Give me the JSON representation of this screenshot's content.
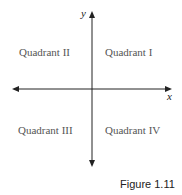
{
  "diagram": {
    "type": "coordinate-plane-quadrants",
    "axes": {
      "x_label": "x",
      "y_label": "y"
    },
    "quadrants": [
      {
        "id": "q1",
        "label": "Quadrant I"
      },
      {
        "id": "q2",
        "label": "Quadrant II"
      },
      {
        "id": "q3",
        "label": "Quadrant III"
      },
      {
        "id": "q4",
        "label": "Quadrant IV"
      }
    ],
    "caption": "Figure 1.11",
    "colors": {
      "axis": "#222222",
      "quadrant_text": "#555555"
    }
  }
}
